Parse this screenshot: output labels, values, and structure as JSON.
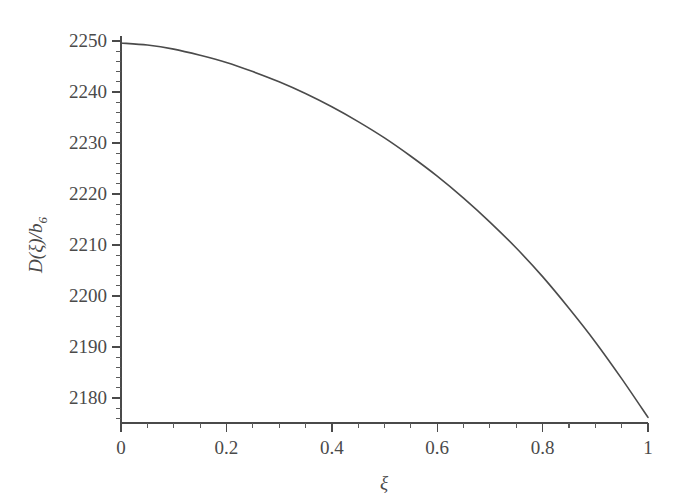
{
  "figure": {
    "background_color": "#ffffff",
    "ink_color": "#4a4a4a",
    "curve_color": "#4b4b4b"
  },
  "chart_data": {
    "type": "line",
    "title": "",
    "xlabel": "ξ",
    "ylabel": "D(ξ)/b",
    "ylabel_subscript": "6",
    "xlim": [
      0,
      1
    ],
    "ylim": [
      2176,
      2250
    ],
    "grid": false,
    "legend": null,
    "x_ticks": [
      0,
      0.2,
      0.4,
      0.6,
      0.8,
      1
    ],
    "x_tick_labels": [
      "0",
      "0.2",
      "0.4",
      "0.6",
      "0.8",
      "1"
    ],
    "x_minor_step": 0.05,
    "y_ticks": [
      2180,
      2190,
      2200,
      2210,
      2220,
      2230,
      2240,
      2250
    ],
    "y_tick_labels": [
      "2180",
      "2190",
      "2200",
      "2210",
      "2220",
      "2230",
      "2240",
      "2250"
    ],
    "y_minor_step": 2,
    "series": [
      {
        "name": "D(ξ)/b6",
        "x": [
          0.0,
          0.05,
          0.1,
          0.15,
          0.2,
          0.25,
          0.3,
          0.35,
          0.4,
          0.45,
          0.5,
          0.55,
          0.6,
          0.65,
          0.7,
          0.75,
          0.8,
          0.85,
          0.9,
          0.95,
          1.0
        ],
        "y": [
          2249.6,
          2249.2,
          2248.4,
          2247.2,
          2245.8,
          2244.0,
          2242.0,
          2239.7,
          2237.1,
          2234.2,
          2231.0,
          2227.4,
          2223.5,
          2219.2,
          2214.5,
          2209.4,
          2203.8,
          2197.6,
          2191.0,
          2183.8,
          2176.2
        ]
      }
    ]
  },
  "axis_titles": {
    "x": "ξ",
    "y_main": "D(ξ)/b",
    "y_sub": "6"
  }
}
